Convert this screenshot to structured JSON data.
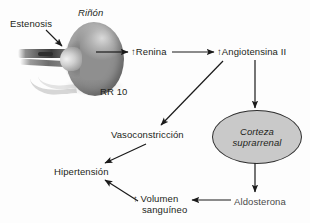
{
  "diagram": {
    "labels": {
      "estenosis": "Estenosis",
      "rinon": "Riñón",
      "rr10": "RR 10",
      "renina": "↑Renina",
      "angiotensina": "↑Angiotensina II",
      "vasoconstriccion": "Vasoconstricción",
      "hipertension": "Hipertensión",
      "volumen_line1": "↑ Volumen",
      "volumen_line2": "sanguíneo",
      "aldosterona": "Aldosterona",
      "corteza_line1": "Corteza",
      "corteza_line2": "suprarrenal"
    },
    "colors": {
      "text": "#231f20",
      "arrow": "#1a1a1a",
      "node_fill": "#c9c9c9",
      "node_border": "#2f2f2f",
      "background": "#fdfdfd"
    }
  }
}
